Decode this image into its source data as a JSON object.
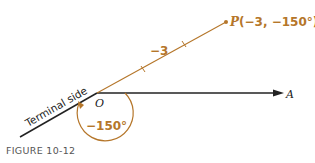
{
  "figure": {
    "caption": "FIGURE 10-12",
    "point_label": "P(−3, −150°)",
    "point_P": "P",
    "point_coords": "(−3, −150°)",
    "segment_label": "−3",
    "origin_label": "O",
    "ray_label": "A",
    "terminal_label": "Terminal side",
    "angle_label": "−150°"
  },
  "colors": {
    "accent": "#b5762a",
    "line": "#222222",
    "caption": "#555555"
  }
}
